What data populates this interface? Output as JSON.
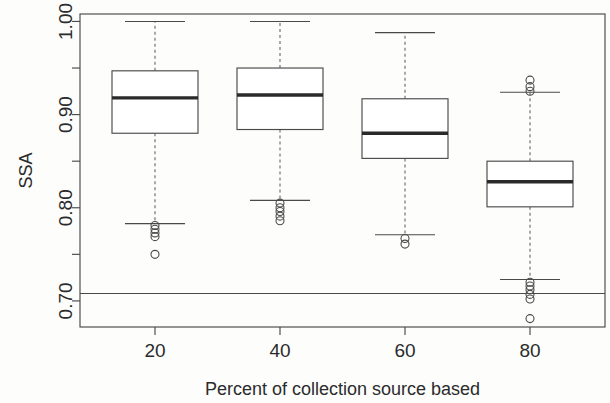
{
  "chart_data": {
    "type": "box",
    "title": "",
    "xlabel": "Percent of collection source based",
    "ylabel": "SSA",
    "categories": [
      "20",
      "40",
      "60",
      "80"
    ],
    "x": [
      20,
      40,
      60,
      80
    ],
    "xlim": [
      8,
      92
    ],
    "ylim": [
      0.672,
      1.008
    ],
    "yticks": [
      0.7,
      0.8,
      0.9,
      1.0
    ],
    "ytick_labels": [
      "0.70",
      "0.80",
      "0.90",
      "1.00"
    ],
    "yminor_ticks": [
      0.75,
      0.85,
      0.95
    ],
    "grid": false,
    "legend": null,
    "reference_line": {
      "orientation": "horizontal",
      "y": 0.708
    },
    "boxes": [
      {
        "category": "20",
        "x": 20,
        "whisker_low": 0.783,
        "q1": 0.88,
        "median": 0.918,
        "q3": 0.947,
        "whisker_high": 1.0,
        "outliers": [
          0.781,
          0.777,
          0.773,
          0.769,
          0.75
        ]
      },
      {
        "category": "40",
        "x": 40,
        "whisker_low": 0.808,
        "q1": 0.884,
        "median": 0.921,
        "q3": 0.95,
        "whisker_high": 1.0,
        "outliers": [
          0.805,
          0.8,
          0.796,
          0.791,
          0.786
        ]
      },
      {
        "category": "60",
        "x": 60,
        "whisker_low": 0.771,
        "q1": 0.853,
        "median": 0.88,
        "q3": 0.917,
        "whisker_high": 0.988,
        "outliers": [
          0.767,
          0.761
        ]
      },
      {
        "category": "80",
        "x": 80,
        "whisker_low": 0.723,
        "q1": 0.801,
        "median": 0.828,
        "q3": 0.85,
        "whisker_high": 0.924,
        "outliers": [
          0.937,
          0.93,
          0.925,
          0.72,
          0.716,
          0.712,
          0.707,
          0.702,
          0.681
        ]
      }
    ],
    "colors": {
      "axis": "#4a4a4a",
      "box_fill": "#ffffff",
      "box_stroke": "#4a4a4a",
      "median": "#2a2a2a",
      "whisker": "#6d6d6d",
      "outlier": "#4a4a4a",
      "reference_line": "#4a4a4a",
      "background": "#fdfdfc"
    }
  }
}
